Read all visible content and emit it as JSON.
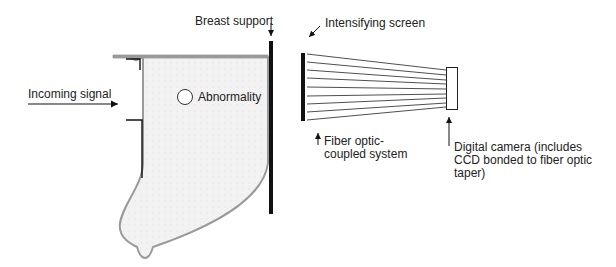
{
  "diagram": {
    "labels": {
      "breast_support": "Breast support",
      "intensifying_screen": "Intensifying screen",
      "incoming_signal": "Incoming signal",
      "abnormality": "Abnormality",
      "fiber_optic_line1": "Fiber optic-",
      "fiber_optic_line2": "coupled system",
      "camera_line1": "Digital camera (includes",
      "camera_line2": "CCD bonded to fiber optic",
      "camera_line3": "taper)"
    },
    "colors": {
      "breast_fill": "#f0f0f0",
      "breast_outline": "#9a9a9a",
      "ink": "#111111"
    },
    "fiber_count": 9
  }
}
